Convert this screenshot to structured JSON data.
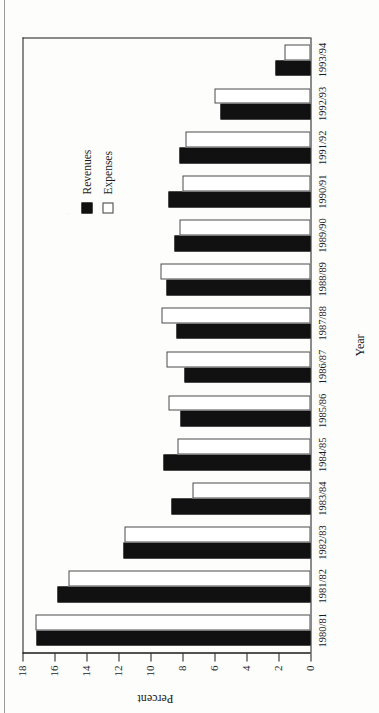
{
  "figure": {
    "kind": "rotated-scanned-bar-chart",
    "orientation": "rotated-90-ccw"
  },
  "chart_data": {
    "type": "bar",
    "title": "",
    "xlabel": "Year",
    "ylabel": "Percent",
    "ylim": [
      0,
      18
    ],
    "ytick_step": 2,
    "yticks": [
      "18",
      "16",
      "14",
      "12",
      "10",
      "8",
      "6",
      "4",
      "2",
      "0"
    ],
    "grid": false,
    "legend_position": "upper-right",
    "categories": [
      "1980/81",
      "1981/82",
      "1982/83",
      "1983/84",
      "1984/85",
      "1985/86",
      "1986/87",
      "1987/88",
      "1988/89",
      "1989/90",
      "1990/91",
      "1991/92",
      "1992/93",
      "1993/94"
    ],
    "series": [
      {
        "name": "Revenues",
        "color": "#111111",
        "values": [
          17.1,
          15.8,
          11.7,
          8.7,
          9.2,
          8.1,
          7.9,
          8.4,
          9.0,
          8.5,
          8.9,
          8.2,
          5.6,
          2.2
        ]
      },
      {
        "name": "Expenses",
        "color": "#ffffff",
        "values": [
          17.2,
          15.1,
          11.6,
          7.4,
          8.3,
          8.9,
          9.0,
          9.3,
          9.4,
          8.2,
          8.0,
          7.8,
          6.0,
          1.6
        ]
      }
    ]
  },
  "legend": {
    "entries": [
      {
        "label": "Revenues",
        "swatch": "filled-square"
      },
      {
        "label": "Expenses",
        "swatch": "open-square"
      }
    ]
  },
  "axes": {
    "value_axis_title": "Percent",
    "category_axis_title": "Year"
  }
}
